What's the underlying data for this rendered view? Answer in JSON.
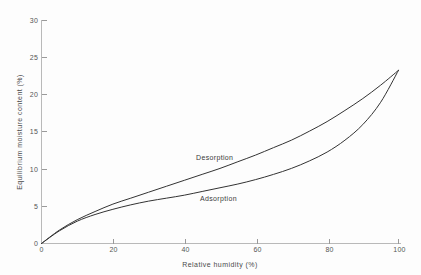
{
  "chart_data": {
    "type": "line",
    "title": "",
    "xlabel": "Relative humidity (%)",
    "ylabel": "Equilibrium  moisture  content (%)",
    "xlim": [
      0,
      100
    ],
    "ylim": [
      0,
      30
    ],
    "xticks": [
      0,
      20,
      40,
      60,
      80,
      100
    ],
    "yticks": [
      0,
      5,
      10,
      15,
      20,
      25,
      30
    ],
    "xtick_labels": [
      "0",
      "20",
      "40",
      "60",
      "80",
      "100"
    ],
    "ytick_labels": [
      "0",
      "5",
      "10",
      "15",
      "20",
      "25",
      "30"
    ],
    "grid": false,
    "legend_position": "inline-annotations",
    "x": [
      0,
      5,
      10,
      15,
      20,
      25,
      30,
      35,
      40,
      45,
      50,
      55,
      60,
      65,
      70,
      75,
      80,
      85,
      90,
      95,
      100
    ],
    "series": [
      {
        "name": "Desorption",
        "values": [
          0.0,
          1.8,
          3.2,
          4.3,
          5.3,
          6.1,
          6.9,
          7.7,
          8.5,
          9.3,
          10.1,
          11.0,
          11.9,
          12.9,
          13.9,
          15.1,
          16.4,
          17.9,
          19.5,
          21.3,
          23.3
        ],
        "annotation": "Desorption",
        "annotation_x": 40,
        "annotation_y": 10.2
      },
      {
        "name": "Adsorption",
        "values": [
          0.0,
          1.7,
          3.0,
          3.9,
          4.6,
          5.2,
          5.7,
          6.1,
          6.5,
          7.0,
          7.5,
          8.0,
          8.6,
          9.3,
          10.1,
          11.1,
          12.3,
          13.9,
          16.0,
          19.0,
          23.3
        ],
        "annotation": "Adsorption",
        "annotation_x": 42,
        "annotation_y": 5.2
      }
    ]
  },
  "axes": {
    "y_title": "Equilibrium  moisture  content (%)",
    "x_title": "Relative humidity (%)"
  },
  "ticks": {
    "y": [
      {
        "label": "30"
      },
      {
        "label": "25"
      },
      {
        "label": "20"
      },
      {
        "label": "15"
      },
      {
        "label": "10"
      },
      {
        "label": "5"
      },
      {
        "label": "0"
      }
    ],
    "x": [
      {
        "label": "0"
      },
      {
        "label": "20"
      },
      {
        "label": "40"
      },
      {
        "label": "60"
      },
      {
        "label": "80"
      },
      {
        "label": "100"
      }
    ]
  },
  "annotations": {
    "desorption": "Desorption",
    "adsorption": "Adsorption"
  },
  "colors": {
    "background": "#fdfdfd",
    "curve": "#333333",
    "axis": "#b9b9b9",
    "tick_text": "#555555",
    "title_text": "#4a4a4a"
  }
}
